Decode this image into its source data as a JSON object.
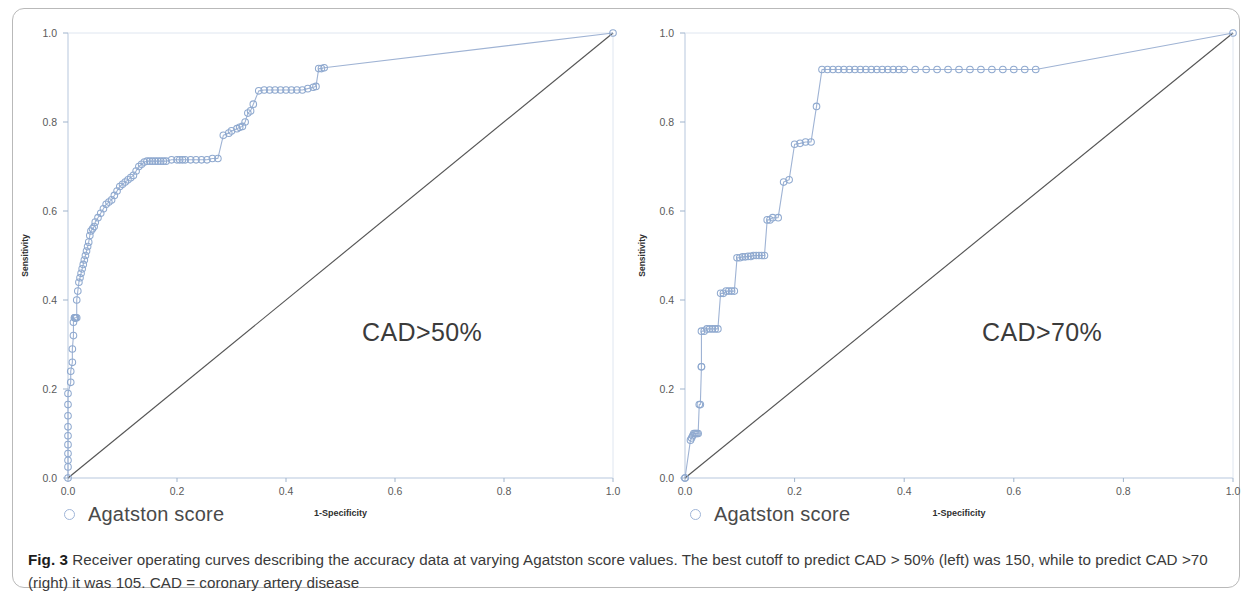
{
  "figure": {
    "caption_label": "Fig. 3",
    "caption_text": " Receiver operating curves describing the accuracy data at varying Agatston score values. The best cutoff to predict CAD > 50% (left) was 150, while to predict CAD >70 (right) it was 105. CAD = coronary artery disease",
    "colors": {
      "marker_stroke": "#8fa9cf",
      "curve_line": "#9fb3d4",
      "diagonal_line": "#555555",
      "axis_line": "#b7c7dd",
      "frame_border": "#b9b9b9",
      "text": "#3a3a3a"
    }
  },
  "panels": [
    {
      "id": "left",
      "annotation": "CAD>50%",
      "legend": {
        "label": "Agatston score",
        "marker": "open-circle-icon"
      },
      "axes": {
        "xlabel": "1-Specificity",
        "ylabel": "Sensitivity",
        "xticks": [
          "0.0",
          "0.2",
          "0.4",
          "0.6",
          "0.8",
          "1.0"
        ],
        "yticks": [
          "0.0",
          "0.2",
          "0.4",
          "0.6",
          "0.8",
          "1.0"
        ],
        "xlim": [
          0,
          1
        ],
        "ylim": [
          0,
          1
        ]
      }
    },
    {
      "id": "right",
      "annotation": "CAD>70%",
      "legend": {
        "label": "Agatston score",
        "marker": "open-circle-icon"
      },
      "axes": {
        "xlabel": "1-Specificity",
        "ylabel": "Sensitivity",
        "xticks": [
          "0.0",
          "0.2",
          "0.4",
          "0.6",
          "0.8",
          "1.0"
        ],
        "yticks": [
          "0.0",
          "0.2",
          "0.4",
          "0.6",
          "0.8",
          "1.0"
        ],
        "xlim": [
          0,
          1
        ],
        "ylim": [
          0,
          1
        ]
      }
    }
  ],
  "chart_data": [
    {
      "type": "line",
      "id": "roc-cad-50",
      "title": "CAD>50%",
      "xlabel": "1-Specificity",
      "ylabel": "Sensitivity",
      "xlim": [
        0,
        1
      ],
      "ylim": [
        0,
        1
      ],
      "grid": false,
      "legend": [
        "Agatston score"
      ],
      "legend_position": "below-left",
      "reference_line": {
        "name": "chance diagonal",
        "x": [
          0,
          1
        ],
        "y": [
          0,
          1
        ]
      },
      "series": [
        {
          "name": "Agatston score",
          "marker": "open circle",
          "x": [
            0.0,
            0.0,
            0.0,
            0.0,
            0.0,
            0.0,
            0.0,
            0.0,
            0.0,
            0.0,
            0.005,
            0.005,
            0.008,
            0.008,
            0.01,
            0.01,
            0.012,
            0.012,
            0.014,
            0.014,
            0.016,
            0.016,
            0.018,
            0.02,
            0.022,
            0.024,
            0.026,
            0.028,
            0.03,
            0.032,
            0.034,
            0.036,
            0.038,
            0.04,
            0.042,
            0.045,
            0.048,
            0.05,
            0.055,
            0.06,
            0.065,
            0.07,
            0.075,
            0.08,
            0.085,
            0.09,
            0.095,
            0.1,
            0.105,
            0.11,
            0.115,
            0.12,
            0.125,
            0.13,
            0.135,
            0.14,
            0.145,
            0.15,
            0.155,
            0.16,
            0.165,
            0.17,
            0.175,
            0.18,
            0.19,
            0.2,
            0.205,
            0.21,
            0.215,
            0.225,
            0.235,
            0.245,
            0.255,
            0.265,
            0.275,
            0.285,
            0.295,
            0.3,
            0.31,
            0.315,
            0.32,
            0.325,
            0.33,
            0.335,
            0.34,
            0.35,
            0.36,
            0.37,
            0.38,
            0.39,
            0.4,
            0.41,
            0.42,
            0.43,
            0.44,
            0.45,
            0.455,
            0.46,
            0.465,
            0.47,
            1.0
          ],
          "y": [
            0.0,
            0.025,
            0.04,
            0.055,
            0.075,
            0.095,
            0.115,
            0.14,
            0.165,
            0.19,
            0.215,
            0.24,
            0.26,
            0.29,
            0.32,
            0.35,
            0.36,
            0.36,
            0.36,
            0.36,
            0.36,
            0.4,
            0.42,
            0.44,
            0.45,
            0.46,
            0.47,
            0.48,
            0.49,
            0.5,
            0.51,
            0.52,
            0.53,
            0.545,
            0.555,
            0.56,
            0.565,
            0.575,
            0.585,
            0.595,
            0.605,
            0.615,
            0.62,
            0.625,
            0.635,
            0.645,
            0.655,
            0.66,
            0.665,
            0.67,
            0.675,
            0.68,
            0.69,
            0.7,
            0.705,
            0.71,
            0.712,
            0.712,
            0.712,
            0.712,
            0.712,
            0.712,
            0.712,
            0.712,
            0.715,
            0.715,
            0.715,
            0.715,
            0.715,
            0.715,
            0.715,
            0.715,
            0.715,
            0.718,
            0.718,
            0.77,
            0.775,
            0.78,
            0.785,
            0.788,
            0.79,
            0.8,
            0.82,
            0.825,
            0.84,
            0.87,
            0.872,
            0.872,
            0.872,
            0.872,
            0.872,
            0.872,
            0.872,
            0.872,
            0.875,
            0.878,
            0.88,
            0.92,
            0.92,
            0.922,
            1.0
          ]
        }
      ]
    },
    {
      "type": "line",
      "id": "roc-cad-70",
      "title": "CAD>70%",
      "xlabel": "1-Specificity",
      "ylabel": "Sensitivity",
      "xlim": [
        0,
        1
      ],
      "ylim": [
        0,
        1
      ],
      "grid": false,
      "legend": [
        "Agatston score"
      ],
      "legend_position": "below-left",
      "reference_line": {
        "name": "chance diagonal",
        "x": [
          0,
          1
        ],
        "y": [
          0,
          1
        ]
      },
      "series": [
        {
          "name": "Agatston score",
          "marker": "open circle",
          "x": [
            0.0,
            0.0,
            0.01,
            0.012,
            0.014,
            0.016,
            0.018,
            0.02,
            0.022,
            0.024,
            0.026,
            0.028,
            0.03,
            0.03,
            0.03,
            0.035,
            0.04,
            0.045,
            0.05,
            0.055,
            0.06,
            0.065,
            0.07,
            0.075,
            0.08,
            0.085,
            0.09,
            0.095,
            0.1,
            0.105,
            0.11,
            0.115,
            0.12,
            0.125,
            0.13,
            0.135,
            0.14,
            0.145,
            0.15,
            0.155,
            0.16,
            0.17,
            0.18,
            0.19,
            0.2,
            0.21,
            0.22,
            0.23,
            0.24,
            0.25,
            0.26,
            0.27,
            0.28,
            0.29,
            0.3,
            0.31,
            0.32,
            0.33,
            0.34,
            0.35,
            0.36,
            0.37,
            0.38,
            0.39,
            0.4,
            0.42,
            0.44,
            0.46,
            0.48,
            0.5,
            0.52,
            0.54,
            0.56,
            0.58,
            0.6,
            0.62,
            0.64,
            1.0
          ],
          "y": [
            0.0,
            0.0,
            0.085,
            0.09,
            0.095,
            0.1,
            0.1,
            0.1,
            0.1,
            0.1,
            0.165,
            0.165,
            0.25,
            0.25,
            0.33,
            0.33,
            0.335,
            0.335,
            0.335,
            0.335,
            0.335,
            0.415,
            0.415,
            0.42,
            0.42,
            0.42,
            0.42,
            0.495,
            0.495,
            0.497,
            0.497,
            0.498,
            0.498,
            0.5,
            0.5,
            0.5,
            0.5,
            0.5,
            0.58,
            0.58,
            0.585,
            0.585,
            0.665,
            0.67,
            0.75,
            0.752,
            0.755,
            0.755,
            0.835,
            0.918,
            0.918,
            0.918,
            0.918,
            0.918,
            0.918,
            0.918,
            0.918,
            0.918,
            0.918,
            0.918,
            0.918,
            0.918,
            0.918,
            0.918,
            0.918,
            0.918,
            0.918,
            0.918,
            0.918,
            0.918,
            0.918,
            0.918,
            0.918,
            0.918,
            0.918,
            0.918,
            0.918,
            1.0
          ]
        }
      ]
    }
  ]
}
